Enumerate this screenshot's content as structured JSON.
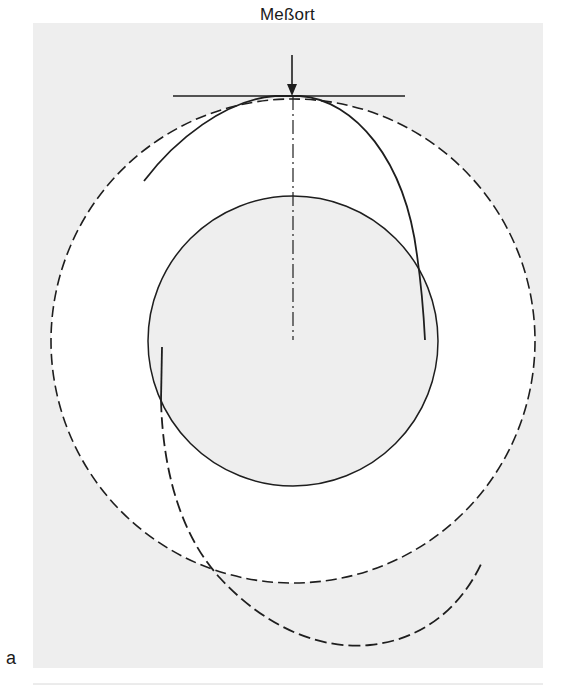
{
  "figure": {
    "measurement_label": "Meßort",
    "panel_label": "a",
    "colors": {
      "panel_background": "#eeeeee",
      "annulus_background": "#ffffff",
      "line": "#1e1e1e"
    },
    "elements": [
      {
        "name": "outer-circle",
        "style": "dashed"
      },
      {
        "name": "inner-circle",
        "style": "solid"
      },
      {
        "name": "tangent-line",
        "style": "solid"
      },
      {
        "name": "center-axis",
        "style": "dash-dot"
      },
      {
        "name": "measurement-arrow",
        "style": "solid"
      },
      {
        "name": "upper-spiral-curve",
        "style": "solid"
      },
      {
        "name": "lower-spiral-curve",
        "style": "solid-then-dashed"
      }
    ]
  }
}
